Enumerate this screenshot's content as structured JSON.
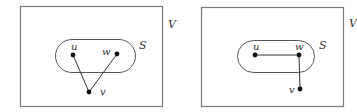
{
  "panels": [
    {
      "id": "left",
      "set_label": "V",
      "subset_label": "S",
      "vertices": [
        {
          "name": "u",
          "x": 73,
          "y": 55
        },
        {
          "name": "w",
          "x": 117,
          "y": 54
        },
        {
          "name": "v",
          "x": 89,
          "y": 92
        }
      ],
      "edges": [
        [
          "u",
          "v"
        ],
        [
          "w",
          "v"
        ]
      ]
    },
    {
      "id": "right",
      "set_label": "V",
      "subset_label": "S",
      "vertices": [
        {
          "name": "u",
          "x": 255,
          "y": 55
        },
        {
          "name": "w",
          "x": 299,
          "y": 55
        },
        {
          "name": "v",
          "x": 300,
          "y": 89
        }
      ],
      "edges": [
        [
          "u",
          "w"
        ],
        [
          "w",
          "v"
        ]
      ]
    }
  ]
}
